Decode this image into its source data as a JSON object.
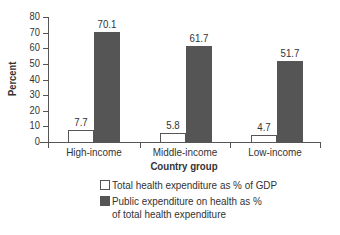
{
  "chart_data": {
    "type": "bar",
    "title": "",
    "xlabel": "Country group",
    "ylabel": "Percent",
    "ylim": [
      0,
      80
    ],
    "yticks": [
      0,
      10,
      20,
      30,
      40,
      50,
      60,
      70,
      80
    ],
    "categories": [
      "High-income",
      "Middle-income",
      "Low-income"
    ],
    "series": [
      {
        "name": "Total health expenditure as % of GDP",
        "color": "#ffffff",
        "values": [
          7.7,
          5.8,
          4.7
        ]
      },
      {
        "name": "Public expenditure on health as % of total health expenditure",
        "color": "#555555",
        "values": [
          70.1,
          61.7,
          51.7
        ]
      }
    ],
    "legend_position": "bottom",
    "grid": false
  },
  "labels": {
    "yticks": [
      "0",
      "10",
      "20",
      "30",
      "40",
      "50",
      "60",
      "70",
      "80"
    ],
    "ylabel": "Percent",
    "xlabel": "Country group",
    "categories": [
      "High-income",
      "Middle-income",
      "Low-income"
    ],
    "values_light": [
      "7.7",
      "5.8",
      "4.7"
    ],
    "values_dark": [
      "70.1",
      "61.7",
      "51.7"
    ],
    "legend": {
      "item1": "Total health expenditure as % of GDP",
      "item2_line1": "Public expenditure on health as %",
      "item2_line2": "of total health expenditure"
    }
  }
}
